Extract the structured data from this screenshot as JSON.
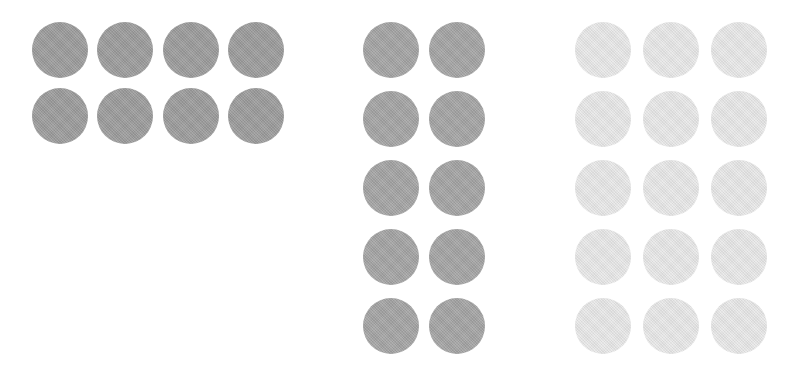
{
  "canvas": {
    "width": 800,
    "height": 372,
    "background_color": "#ffffff"
  },
  "chart_data": {
    "type": "table",
    "title": "",
    "subtitle": "",
    "xlabel": "",
    "ylabel": "",
    "legend_position": "none",
    "grid": false,
    "annotations": [],
    "categories": [
      "group-1",
      "group-2",
      "group-3"
    ],
    "values": [
      8,
      10,
      15
    ],
    "series": [
      {
        "name": "dot_count",
        "values": [
          8,
          10,
          15
        ]
      },
      {
        "name": "columns",
        "values": [
          4,
          2,
          3
        ]
      },
      {
        "name": "rows",
        "values": [
          2,
          5,
          5
        ]
      }
    ],
    "groups": [
      {
        "id": "group-1",
        "count": 8,
        "columns": 4,
        "rows": 2,
        "fill_color": "#9b9b9b",
        "diameter": 56,
        "origin_x": 32,
        "origin_y": 22,
        "pitch_x": 65.3,
        "pitch_y": 66
      },
      {
        "id": "group-2",
        "count": 10,
        "columns": 2,
        "rows": 5,
        "fill_color": "#a3a3a3",
        "diameter": 56,
        "origin_x": 363,
        "origin_y": 22,
        "pitch_x": 66,
        "pitch_y": 69
      },
      {
        "id": "group-3",
        "count": 15,
        "columns": 3,
        "rows": 5,
        "fill_color": "#e8e8e8",
        "diameter": 56,
        "origin_x": 575,
        "origin_y": 22,
        "pitch_x": 68,
        "pitch_y": 69
      }
    ],
    "total_dots": 33
  }
}
